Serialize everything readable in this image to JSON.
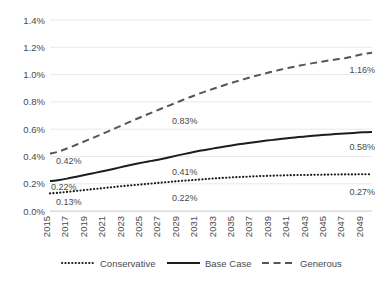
{
  "chart_data": {
    "type": "line",
    "title": "",
    "subtitle": "",
    "xlabel": "",
    "ylabel": "",
    "grid": true,
    "legend_position": "bottom",
    "xlim": [
      2015,
      2050
    ],
    "ylim": [
      0.0,
      1.4
    ],
    "y_ticks": [
      "0.0%",
      "0.2%",
      "0.4%",
      "0.6%",
      "0.8%",
      "1.0%",
      "1.2%",
      "1.4%"
    ],
    "y_tick_values": [
      0.0,
      0.2,
      0.4,
      0.6,
      0.8,
      1.0,
      1.2,
      1.4
    ],
    "x_tick_labels": [
      "2015",
      "2017",
      "2019",
      "2021",
      "2023",
      "2025",
      "2027",
      "2029",
      "2031",
      "2033",
      "2035",
      "2037",
      "2039",
      "2041",
      "2043",
      "2045",
      "2047",
      "2049"
    ],
    "x": [
      2015,
      2016,
      2017,
      2018,
      2019,
      2020,
      2021,
      2022,
      2023,
      2024,
      2025,
      2026,
      2027,
      2028,
      2029,
      2030,
      2031,
      2032,
      2033,
      2034,
      2035,
      2036,
      2037,
      2038,
      2039,
      2040,
      2041,
      2042,
      2043,
      2044,
      2045,
      2046,
      2047,
      2048,
      2049,
      2050
    ],
    "series": [
      {
        "name": "Conservative",
        "style": "dotted",
        "color": "#1d1d1d",
        "values": [
          0.13,
          0.135,
          0.142,
          0.149,
          0.156,
          0.163,
          0.17,
          0.177,
          0.184,
          0.19,
          0.196,
          0.202,
          0.208,
          0.214,
          0.22,
          0.225,
          0.23,
          0.235,
          0.24,
          0.244,
          0.248,
          0.251,
          0.254,
          0.257,
          0.259,
          0.261,
          0.263,
          0.264,
          0.265,
          0.266,
          0.267,
          0.268,
          0.269,
          0.269,
          0.27,
          0.27
        ]
      },
      {
        "name": "Base Case",
        "style": "solid",
        "color": "#1d1d1d",
        "values": [
          0.22,
          0.228,
          0.24,
          0.254,
          0.268,
          0.282,
          0.296,
          0.311,
          0.326,
          0.341,
          0.355,
          0.368,
          0.38,
          0.395,
          0.41,
          0.424,
          0.438,
          0.45,
          0.462,
          0.473,
          0.484,
          0.494,
          0.503,
          0.512,
          0.52,
          0.528,
          0.535,
          0.542,
          0.548,
          0.554,
          0.559,
          0.564,
          0.569,
          0.573,
          0.577,
          0.58
        ]
      },
      {
        "name": "Generous",
        "style": "dashed",
        "color": "#555555",
        "values": [
          0.42,
          0.437,
          0.463,
          0.49,
          0.518,
          0.546,
          0.575,
          0.604,
          0.634,
          0.663,
          0.692,
          0.72,
          0.748,
          0.775,
          0.802,
          0.83,
          0.855,
          0.879,
          0.902,
          0.924,
          0.945,
          0.965,
          0.984,
          1.002,
          1.019,
          1.035,
          1.05,
          1.064,
          1.077,
          1.089,
          1.1,
          1.11,
          1.12,
          1.135,
          1.15,
          1.16
        ]
      }
    ],
    "data_labels": [
      {
        "text": "0.42%",
        "series": "Generous",
        "anchor": "start-left"
      },
      {
        "text": "0.22%",
        "series": "Base Case",
        "anchor": "start-left"
      },
      {
        "text": "0.13%",
        "series": "Conservative",
        "anchor": "start-left"
      },
      {
        "text": "0.83%",
        "series": "Generous",
        "anchor": "mid"
      },
      {
        "text": "0.41%",
        "series": "Base Case",
        "anchor": "mid"
      },
      {
        "text": "0.22%",
        "series": "Conservative",
        "anchor": "mid"
      },
      {
        "text": "1.16%",
        "series": "Generous",
        "anchor": "end-right"
      },
      {
        "text": "0.58%",
        "series": "Base Case",
        "anchor": "end-right"
      },
      {
        "text": "0.27%",
        "series": "Conservative",
        "anchor": "end-right"
      }
    ],
    "legend": [
      {
        "label": "Conservative",
        "style": "dotted"
      },
      {
        "label": "Base Case",
        "style": "solid"
      },
      {
        "label": "Generous",
        "style": "dashed"
      }
    ]
  }
}
